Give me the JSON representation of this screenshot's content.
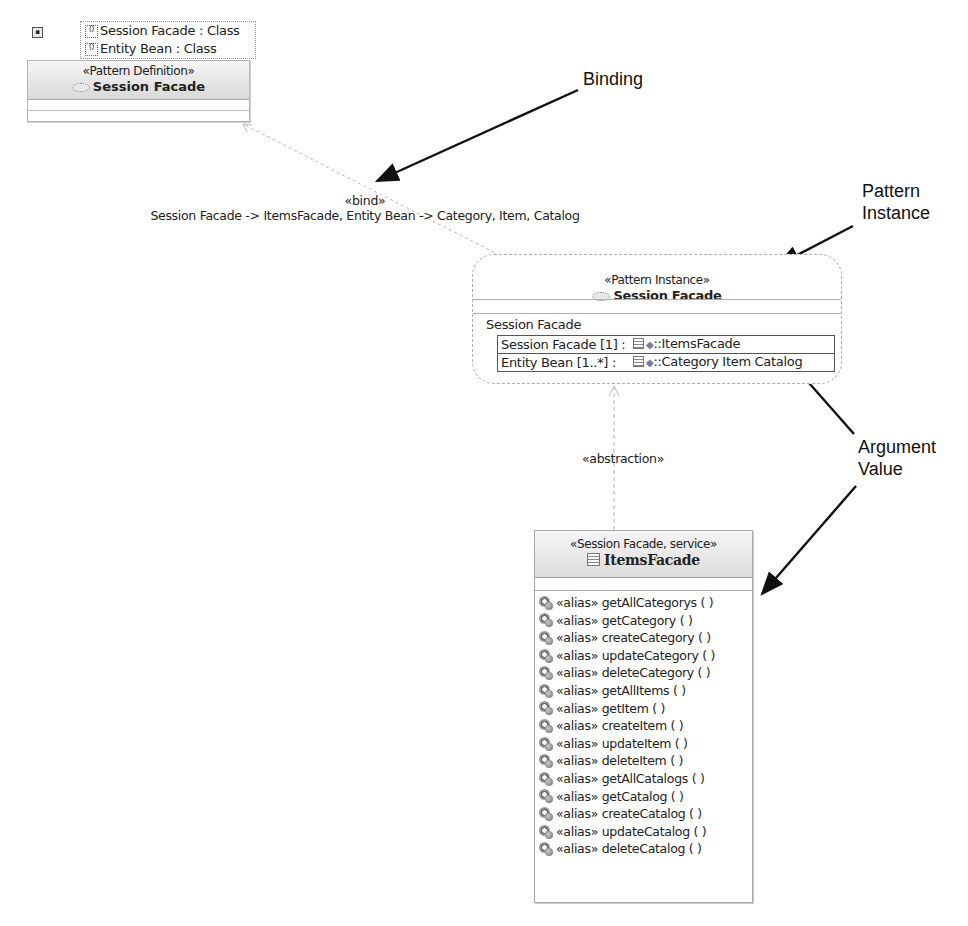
{
  "template_parameters": {
    "items": [
      {
        "label": "Session Facade : Class",
        "icon": "template-parameter-icon"
      },
      {
        "label": "Entity Bean : Class",
        "icon": "template-parameter-icon"
      }
    ]
  },
  "pattern_definition": {
    "stereotype": "«Pattern Definition»",
    "name": "Session Facade",
    "icon": "collaboration-ellipse-icon"
  },
  "bind_connector": {
    "stereotype": "«bind»",
    "label": "Session Facade -> ItemsFacade, Entity Bean -> Category, Item, Catalog"
  },
  "pattern_instance": {
    "stereotype": "«Pattern Instance»",
    "name": "Session Facade",
    "section_title": "Session Facade",
    "arguments": [
      {
        "parameter": "Session Facade [1] :",
        "value": "::ItemsFacade"
      },
      {
        "parameter": "Entity Bean [1..*] :",
        "value": "::Category Item Catalog"
      }
    ]
  },
  "abstraction_connector": {
    "stereotype": "«abstraction»"
  },
  "items_facade": {
    "stereotype": "«Session Facade, service»",
    "name": "ItemsFacade",
    "operations": [
      "«alias» getAllCategorys ( )",
      "«alias» getCategory ( )",
      "«alias» createCategory ( )",
      "«alias» updateCategory ( )",
      "«alias» deleteCategory ( )",
      "«alias» getAllItems ( )",
      "«alias» getItem ( )",
      "«alias» createItem ( )",
      "«alias» updateItem ( )",
      "«alias» deleteItem ( )",
      "«alias» getAllCatalogs ( )",
      "«alias» getCatalog ( )",
      "«alias» createCatalog ( )",
      "«alias» updateCatalog ( )",
      "«alias» deleteCatalog ( )"
    ]
  },
  "annotations": {
    "binding": "Binding",
    "pattern_instance_line1": "Pattern",
    "pattern_instance_line2": "Instance",
    "argument_value_line1": "Argument",
    "argument_value_line2": "Value"
  }
}
